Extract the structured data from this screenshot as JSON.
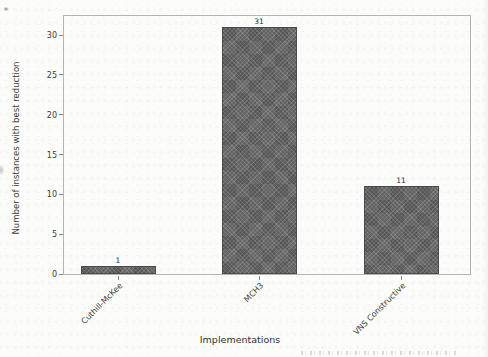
{
  "page": {
    "background": "#fcfcfa"
  },
  "chart_data": {
    "type": "bar",
    "title": "",
    "categories": [
      "Cuthill-McKee",
      "MCH3",
      "VNS Constructive"
    ],
    "values": [
      1,
      31,
      11
    ],
    "xlabel": "Implementations",
    "ylabel": "Number of instances with best reduction",
    "yticks": [
      0,
      5,
      10,
      15,
      20,
      25,
      30
    ],
    "ylim": [
      0,
      32.4
    ],
    "grid": false,
    "legend_position": "none",
    "bar_color": "#5a5a5a",
    "bar_edge_color": "#4b4b4b",
    "axis_frame_color": "#b4b4b0",
    "tick_color": "#8a8a8a",
    "text_color": "#3c3c3c"
  }
}
